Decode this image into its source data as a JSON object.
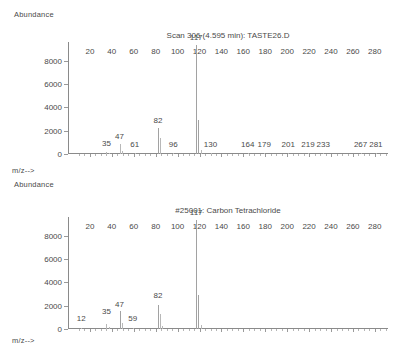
{
  "panels": [
    {
      "axis_caption_top": "Abundance",
      "axis_caption_bottom": "m/z-->",
      "chart_data": {
        "type": "bar",
        "title": "Scan 306 (4.595 min): TASTE26.D",
        "xlabel": "m/z-->",
        "ylabel": "Abundance",
        "xlim": [
          0,
          292
        ],
        "ylim": [
          0,
          9600
        ],
        "grid": false,
        "legend": "none",
        "xticks": [
          20,
          40,
          60,
          80,
          100,
          120,
          140,
          160,
          180,
          200,
          220,
          240,
          260,
          280
        ],
        "yticks": [
          0,
          2000,
          4000,
          6000,
          8000
        ],
        "x": [
          35,
          37,
          47,
          49,
          61,
          82,
          84,
          96,
          117,
          119,
          121,
          130,
          164,
          179,
          201,
          219,
          233,
          267,
          281
        ],
        "values": [
          210,
          110,
          830,
          300,
          95,
          2230,
          1400,
          70,
          9350,
          2950,
          330,
          60,
          35,
          35,
          35,
          35,
          35,
          35,
          35
        ],
        "annotations": [
          {
            "mz": 35,
            "label": "35",
            "y": 520
          },
          {
            "mz": 47,
            "label": "47",
            "y": 1080
          },
          {
            "mz": 61,
            "label": "61",
            "y": 420
          },
          {
            "mz": 82,
            "label": "82",
            "y": 2500
          },
          {
            "mz": 96,
            "label": "96",
            "y": 420
          },
          {
            "mz": 117,
            "label": "117",
            "y": 9600
          },
          {
            "mz": 130,
            "label": "130",
            "y": 420
          },
          {
            "mz": 164,
            "label": "164",
            "y": 420
          },
          {
            "mz": 179,
            "label": "179",
            "y": 420
          },
          {
            "mz": 201,
            "label": "201",
            "y": 420
          },
          {
            "mz": 219,
            "label": "219",
            "y": 420
          },
          {
            "mz": 233,
            "label": "233",
            "y": 420
          },
          {
            "mz": 267,
            "label": "267",
            "y": 420
          },
          {
            "mz": 281,
            "label": "281",
            "y": 420
          }
        ]
      }
    },
    {
      "axis_caption_top": "Abundance",
      "axis_caption_bottom": "m/z-->",
      "chart_data": {
        "type": "bar",
        "title": "#25001: Carbon Tetrachloride",
        "xlabel": "m/z-->",
        "ylabel": "Abundance",
        "xlim": [
          0,
          292
        ],
        "ylim": [
          0,
          9600
        ],
        "grid": false,
        "legend": "none",
        "xticks": [
          20,
          40,
          60,
          80,
          100,
          120,
          140,
          160,
          180,
          200,
          220,
          240,
          260,
          280
        ],
        "yticks": [
          0,
          2000,
          4000,
          6000,
          8000
        ],
        "x": [
          12,
          35,
          37,
          47,
          49,
          59,
          82,
          84,
          86,
          117,
          119,
          121
        ],
        "values": [
          60,
          430,
          180,
          1520,
          520,
          70,
          2080,
          1330,
          260,
          9350,
          2900,
          330
        ],
        "annotations": [
          {
            "mz": 12,
            "label": "12",
            "y": 520
          },
          {
            "mz": 35,
            "label": "35",
            "y": 1080
          },
          {
            "mz": 47,
            "label": "47",
            "y": 1700
          },
          {
            "mz": 59,
            "label": "59",
            "y": 520
          },
          {
            "mz": 82,
            "label": "82",
            "y": 2500
          },
          {
            "mz": 117,
            "label": "117",
            "y": 9600
          }
        ]
      }
    }
  ]
}
